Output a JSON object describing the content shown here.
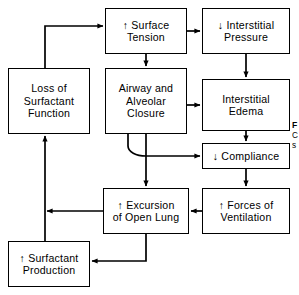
{
  "figure": {
    "type": "flowchart",
    "arrow_up": "↑",
    "arrow_down": "↓"
  },
  "nodes": [
    {
      "id": "surface-tension",
      "lines": [
        "↑ Surface",
        "Tension"
      ],
      "x": 105,
      "y": 8,
      "w": 82,
      "h": 46
    },
    {
      "id": "interstitial-pressure",
      "lines": [
        "↓ Interstitial",
        "Pressure"
      ],
      "x": 202,
      "y": 8,
      "w": 88,
      "h": 46
    },
    {
      "id": "loss-of-surfactant-function",
      "lines": [
        "Loss of",
        "Surfactant",
        "Function"
      ],
      "x": 8,
      "y": 68,
      "w": 82,
      "h": 66
    },
    {
      "id": "airway-alveolar-closure",
      "lines": [
        "Airway and",
        "Alveolar",
        "Closure"
      ],
      "x": 105,
      "y": 68,
      "w": 82,
      "h": 66
    },
    {
      "id": "interstitial-edema",
      "lines": [
        "Interstitial",
        "Edema"
      ],
      "x": 202,
      "y": 79,
      "w": 88,
      "h": 52
    },
    {
      "id": "compliance",
      "lines": [
        "↓ Compliance"
      ],
      "x": 202,
      "y": 143,
      "w": 88,
      "h": 26
    },
    {
      "id": "forces-of-ventilation",
      "lines": [
        "↑ Forces of",
        "Ventilation"
      ],
      "x": 202,
      "y": 188,
      "w": 88,
      "h": 46
    },
    {
      "id": "excursion-of-open-lung",
      "lines": [
        "↑ Excursion",
        "of Open Lung"
      ],
      "x": 103,
      "y": 188,
      "w": 86,
      "h": 46
    },
    {
      "id": "surfactant-production",
      "lines": [
        "↑ Surfactant",
        "Production"
      ],
      "x": 8,
      "y": 241,
      "w": 82,
      "h": 46
    }
  ],
  "edges": [
    {
      "from": "surface-tension",
      "to": "interstitial-pressure",
      "label": ""
    },
    {
      "from": "surface-tension",
      "to": "airway-alveolar-closure",
      "label": ""
    },
    {
      "from": "interstitial-pressure",
      "to": "interstitial-edema",
      "label": ""
    },
    {
      "from": "airway-alveolar-closure",
      "to": "interstitial-edema",
      "label": ""
    },
    {
      "from": "airway-alveolar-closure",
      "to": "compliance",
      "label": ""
    },
    {
      "from": "airway-alveolar-closure",
      "to": "excursion-of-open-lung",
      "label": ""
    },
    {
      "from": "interstitial-edema",
      "to": "compliance",
      "label": ""
    },
    {
      "from": "compliance",
      "to": "forces-of-ventilation",
      "label": ""
    },
    {
      "from": "forces-of-ventilation",
      "to": "excursion-of-open-lung",
      "label": ""
    },
    {
      "from": "excursion-of-open-lung",
      "to": "surfactant-production",
      "label": ""
    },
    {
      "from": "surfactant-production",
      "to": "loss-of-surfactant-function",
      "label": ""
    },
    {
      "from": "loss-of-surfactant-function",
      "to": "surface-tension",
      "label": ""
    }
  ],
  "caption": {
    "line1": "F",
    "line2": "C",
    "line3": "s"
  }
}
